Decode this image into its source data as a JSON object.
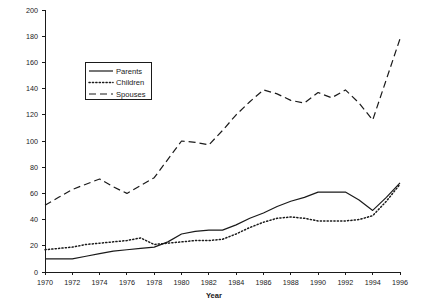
{
  "chart_data": {
    "type": "line",
    "title": "",
    "xlabel": "Year",
    "ylabel": "",
    "x": [
      1970,
      1971,
      1972,
      1973,
      1974,
      1975,
      1976,
      1977,
      1978,
      1979,
      1980,
      1981,
      1982,
      1983,
      1984,
      1985,
      1986,
      1987,
      1988,
      1989,
      1990,
      1991,
      1992,
      1993,
      1994,
      1995,
      1996
    ],
    "xticks": [
      1970,
      1972,
      1974,
      1976,
      1978,
      1980,
      1982,
      1984,
      1986,
      1988,
      1990,
      1992,
      1994,
      1996
    ],
    "xtick_labels": [
      "1970",
      "1972",
      "1974",
      "1976",
      "1978",
      "1980",
      "1982",
      "1984",
      "1986",
      "1988",
      "1990",
      "1992",
      "1994",
      "1996"
    ],
    "yticks": [
      0,
      20,
      40,
      60,
      80,
      100,
      120,
      140,
      160,
      180,
      200
    ],
    "ytick_labels": [
      "0",
      "20",
      "40",
      "60",
      "80",
      "100",
      "120",
      "140",
      "160",
      "180",
      "200"
    ],
    "xlim": [
      1970,
      1996
    ],
    "ylim": [
      0,
      200
    ],
    "grid": false,
    "legend_position": "upper-left-inset",
    "series": [
      {
        "name": "Parents",
        "style": "solid",
        "color": "#1a1a1a",
        "values": [
          10,
          10,
          10,
          12,
          14,
          16,
          17,
          18,
          19,
          23,
          29,
          31,
          32,
          32,
          36,
          41,
          45,
          50,
          54,
          57,
          61,
          61,
          61,
          55,
          47,
          57,
          68
        ]
      },
      {
        "name": "Children",
        "style": "dotted",
        "color": "#1a1a1a",
        "values": [
          17,
          18,
          19,
          21,
          22,
          23,
          24,
          26,
          21,
          22,
          23,
          24,
          24,
          25,
          29,
          34,
          38,
          41,
          42,
          41,
          39,
          39,
          39,
          40,
          43,
          54,
          67
        ]
      },
      {
        "name": "Spouses",
        "style": "dashed",
        "color": "#1a1a1a",
        "values": [
          51,
          57,
          63,
          67,
          71,
          65,
          60,
          66,
          72,
          86,
          100,
          99,
          97,
          108,
          120,
          130,
          139,
          136,
          131,
          129,
          137,
          133,
          139,
          129,
          116,
          147,
          178
        ]
      }
    ]
  },
  "legend": {
    "items": [
      {
        "label": "Parents",
        "style": "solid"
      },
      {
        "label": "Children",
        "style": "dotted"
      },
      {
        "label": "Spouses",
        "style": "dashed"
      }
    ]
  }
}
